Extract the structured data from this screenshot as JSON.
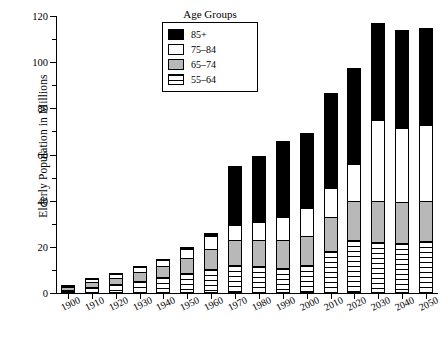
{
  "chart_data": {
    "type": "bar",
    "stacked": true,
    "title": "",
    "xlabel": "",
    "ylabel": "Elderly Population in Millions",
    "ylim": [
      0,
      120
    ],
    "ytick_values": [
      0,
      20,
      40,
      60,
      80,
      100,
      120
    ],
    "ytick_labels": [
      "0",
      "20",
      "40",
      "60",
      "80",
      "100",
      "120"
    ],
    "yminor_values": [
      10,
      30,
      50,
      70,
      90,
      110
    ],
    "grid": false,
    "legend_title": "Age Groups",
    "legend_position": "top-center",
    "categories": [
      "1900",
      "1910",
      "1920",
      "1930",
      "1940",
      "1950",
      "1960",
      "1970",
      "1980",
      "1990",
      "2000",
      "2010",
      "2020",
      "2030",
      "2040",
      "2050"
    ],
    "series": [
      {
        "name": "55–64",
        "color": "#ffffff",
        "pattern": "horizontal-stripes",
        "values": [
          1.3,
          2.7,
          3.8,
          5.2,
          6.8,
          8.8,
          10.5,
          12.0,
          11.7,
          11.0,
          12.3,
          18.0,
          22.8,
          22.0,
          21.5,
          22.5
        ]
      },
      {
        "name": "65–74",
        "color": "#b8b8b8",
        "pattern": "solid-gray",
        "values": [
          1.2,
          2.2,
          2.9,
          4.0,
          4.8,
          6.5,
          8.5,
          10.8,
          11.3,
          12.0,
          12.3,
          15.0,
          17.0,
          18.0,
          18.0,
          17.5
        ]
      },
      {
        "name": "75–84",
        "color": "#ffffff",
        "pattern": "solid-white",
        "values": [
          0.6,
          1.1,
          1.5,
          2.1,
          2.7,
          3.7,
          5.6,
          6.8,
          7.7,
          10.0,
          12.4,
          12.5,
          16.0,
          35.0,
          32.0,
          33.0
        ]
      },
      {
        "name": "85+",
        "color": "#000000",
        "pattern": "solid-black",
        "values": [
          0.1,
          0.2,
          0.3,
          0.4,
          0.6,
          0.9,
          1.5,
          25.4,
          28.8,
          33.0,
          32.5,
          41.0,
          41.5,
          42.0,
          42.5,
          42.0
        ]
      }
    ],
    "totals": [
      3.2,
      6.2,
      8.5,
      11.7,
      14.9,
      19.9,
      26.1,
      55.0,
      59.5,
      66.0,
      69.5,
      86.5,
      97.3,
      117.0,
      114.0,
      115.0
    ]
  },
  "legend": {
    "title": "Age Groups",
    "items": [
      {
        "label": "85+",
        "swatch": "black-swatch"
      },
      {
        "label": "75–84",
        "swatch": "white-swatch"
      },
      {
        "label": "65–74",
        "swatch": "gray-swatch"
      },
      {
        "label": "55–64",
        "swatch": "striped-swatch"
      }
    ]
  },
  "axes": {
    "y_title": "Elderly Population in Millions"
  }
}
